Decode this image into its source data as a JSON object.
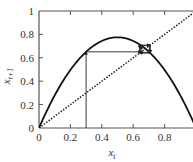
{
  "chart_data": {
    "type": "line",
    "title": "",
    "xlabel": "x_t",
    "ylabel": "x_{t+1}",
    "xlim": [
      0,
      1
    ],
    "ylim": [
      0,
      1
    ],
    "grid": false,
    "x_ticks": [
      "0",
      "0.2",
      "0.4",
      "0.6",
      "0.8"
    ],
    "y_ticks": [
      "0",
      "0.2",
      "0.4",
      "0.6",
      "0.8",
      "1"
    ],
    "series": [
      {
        "name": "logistic map",
        "style": "solid",
        "function": "r*x*(1-x)",
        "r": 3.1,
        "x": [
          0,
          0.1,
          0.2,
          0.3,
          0.4,
          0.5,
          0.6,
          0.7,
          0.8,
          0.9,
          1.0
        ],
        "values": [
          0,
          0.279,
          0.496,
          0.651,
          0.744,
          0.775,
          0.744,
          0.651,
          0.496,
          0.279,
          0
        ]
      },
      {
        "name": "identity line",
        "style": "dotted",
        "x": [
          0,
          1
        ],
        "values": [
          0,
          1
        ]
      },
      {
        "name": "cobweb iteration",
        "style": "solid-arrows",
        "x0": 0.3,
        "iterates": [
          0.3,
          0.651,
          0.704,
          0.646,
          0.709,
          0.64,
          0.714
        ]
      }
    ],
    "annotations": []
  },
  "axes": {
    "x_label_main": "x",
    "x_label_sub": "t",
    "y_label_main": "x",
    "y_label_sub": "t+1"
  }
}
